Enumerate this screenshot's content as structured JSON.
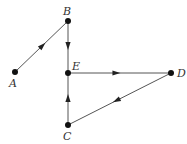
{
  "diagram": {
    "type": "directed-graph",
    "nodes": [
      {
        "id": "A",
        "label": "A",
        "x": 15,
        "y": 72,
        "lx": 9,
        "ly": 87
      },
      {
        "id": "B",
        "label": "B",
        "x": 68,
        "y": 21,
        "lx": 63,
        "ly": 15
      },
      {
        "id": "C",
        "label": "C",
        "x": 68,
        "y": 125,
        "lx": 63,
        "ly": 140
      },
      {
        "id": "D",
        "label": "D",
        "x": 171,
        "y": 73,
        "lx": 177,
        "ly": 77
      },
      {
        "id": "E",
        "label": "E",
        "x": 68,
        "y": 73,
        "lx": 72,
        "ly": 70
      }
    ],
    "edges": [
      {
        "from": "A",
        "to": "B",
        "arrow_t": 0.52
      },
      {
        "from": "B",
        "to": "E",
        "arrow_t": 0.48
      },
      {
        "from": "E",
        "to": "D",
        "arrow_t": 0.47
      },
      {
        "from": "D",
        "to": "C",
        "arrow_t": 0.53
      },
      {
        "from": "C",
        "to": "E",
        "arrow_t": 0.52
      }
    ]
  }
}
